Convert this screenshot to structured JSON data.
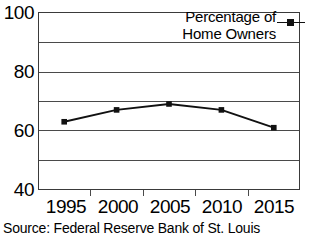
{
  "chart_data": {
    "type": "line",
    "title": "",
    "xlabel": "",
    "ylabel": "",
    "categories": [
      "1995",
      "2000",
      "2005",
      "2010",
      "2015"
    ],
    "series": [
      {
        "name": "Percentage of Home Owners",
        "values": [
          63,
          67,
          69,
          67,
          61
        ]
      }
    ],
    "ylim": [
      40,
      100
    ],
    "yticks_labeled": [
      "40",
      "60",
      "80",
      "100"
    ],
    "ygridlines": [
      40,
      50,
      60,
      70,
      80,
      90,
      100
    ],
    "grid": true,
    "legend_position": "top-right",
    "legend_line1": "Percentage of",
    "legend_line2": "Home Owners",
    "marker": "filled-square",
    "line_color": "#111111",
    "grid_color": "#4a4a4a"
  },
  "caption": {
    "source": "Source: Federal Reserve Bank of St. Louis"
  }
}
